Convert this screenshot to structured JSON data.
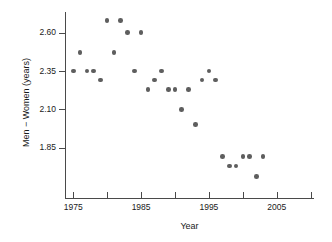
{
  "chart_data": {
    "type": "scatter",
    "title": "",
    "xlabel": "Year",
    "ylabel": "Men − Women (years)",
    "xlim": [
      1972.8,
      2010.5
    ],
    "ylim": [
      1.69,
      2.72
    ],
    "grid": false,
    "legend": null,
    "marker_color": "#5e5e5e",
    "axis_color": "#4a4a4a",
    "xticks": [
      1975,
      1980,
      1985,
      1990,
      1995,
      2000,
      2005,
      2010
    ],
    "xtick_labels": [
      "1975",
      "",
      "1985",
      "",
      "1995",
      "",
      "2005",
      ""
    ],
    "yticks": [
      2.6,
      2.35,
      2.1,
      1.85
    ],
    "ytick_labels": [
      "2.60",
      "2.35",
      "2.10",
      "1.85"
    ],
    "x": [
      1975,
      1976,
      1977,
      1978,
      1979,
      1980,
      1981,
      1982,
      1983,
      1984,
      1985,
      1986,
      1987,
      1988,
      1989,
      1990,
      1991,
      1992,
      1993,
      1994,
      1995,
      1996,
      1997,
      1998,
      1999,
      2000,
      2001,
      2002,
      2003
    ],
    "y": [
      2.35,
      2.47,
      2.35,
      2.35,
      2.29,
      2.68,
      2.47,
      2.68,
      2.6,
      2.35,
      2.6,
      2.23,
      2.29,
      2.35,
      2.23,
      2.23,
      2.1,
      2.23,
      2.0,
      2.29,
      2.35,
      2.29,
      1.79,
      1.73,
      1.73,
      1.79,
      1.79,
      1.66,
      1.79
    ],
    "points": [
      {
        "x": 1975,
        "y": 2.35
      },
      {
        "x": 1976,
        "y": 2.47
      },
      {
        "x": 1977,
        "y": 2.35
      },
      {
        "x": 1978,
        "y": 2.35
      },
      {
        "x": 1979,
        "y": 2.29
      },
      {
        "x": 1980,
        "y": 2.68
      },
      {
        "x": 1981,
        "y": 2.47
      },
      {
        "x": 1982,
        "y": 2.68
      },
      {
        "x": 1983,
        "y": 2.6
      },
      {
        "x": 1984,
        "y": 2.35
      },
      {
        "x": 1985,
        "y": 2.6
      },
      {
        "x": 1986,
        "y": 2.23
      },
      {
        "x": 1987,
        "y": 2.29
      },
      {
        "x": 1988,
        "y": 2.35
      },
      {
        "x": 1989,
        "y": 2.23
      },
      {
        "x": 1990,
        "y": 2.23
      },
      {
        "x": 1991,
        "y": 2.1
      },
      {
        "x": 1992,
        "y": 2.23
      },
      {
        "x": 1993,
        "y": 2.0
      },
      {
        "x": 1994,
        "y": 2.29
      },
      {
        "x": 1995,
        "y": 2.35
      },
      {
        "x": 1996,
        "y": 2.29
      },
      {
        "x": 1997,
        "y": 1.79
      },
      {
        "x": 1998,
        "y": 1.73
      },
      {
        "x": 1999,
        "y": 1.73
      },
      {
        "x": 2000,
        "y": 1.79
      },
      {
        "x": 2001,
        "y": 1.79
      },
      {
        "x": 2002,
        "y": 1.66
      },
      {
        "x": 2003,
        "y": 1.79
      }
    ]
  }
}
